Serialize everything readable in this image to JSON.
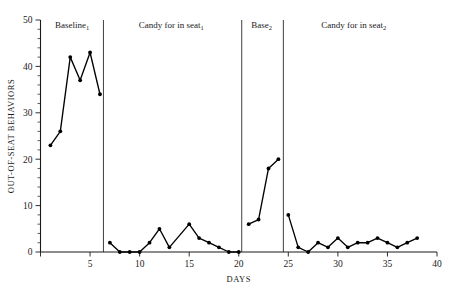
{
  "chart_data": {
    "type": "line",
    "title": "",
    "xlabel": "DAYS",
    "ylabel": "OUT-OF-SEAT BEHAVIORS",
    "xlim": [
      0,
      40
    ],
    "ylim": [
      0,
      50
    ],
    "xticks": [
      0,
      5,
      10,
      15,
      20,
      25,
      30,
      35,
      40
    ],
    "xtick_labels": [
      "",
      "5",
      "10",
      "15",
      "20",
      "25",
      "30",
      "35",
      "40"
    ],
    "yticks": [
      0,
      10,
      20,
      30,
      40,
      50
    ],
    "ytick_labels": [
      "0",
      "10",
      "20",
      "30",
      "40",
      "50"
    ],
    "yminor_step": 2,
    "grid": false,
    "legend": "none",
    "series": [
      {
        "name": "Out-of-seat behaviors",
        "x": [
          1,
          2,
          3,
          4,
          5,
          6,
          7,
          8,
          9,
          10,
          11,
          12,
          13,
          15,
          16,
          17,
          18,
          19,
          20,
          21,
          22,
          23,
          24,
          25,
          26,
          27,
          28,
          29,
          30,
          31,
          32,
          33,
          34,
          35,
          36,
          37,
          38
        ],
        "values": [
          23,
          26,
          42,
          37,
          43,
          34,
          2,
          0,
          0,
          0,
          2,
          5,
          1,
          6,
          3,
          2,
          1,
          0,
          0,
          6,
          7,
          18,
          20,
          8,
          1,
          0,
          2,
          1,
          3,
          1,
          2,
          2,
          3,
          2,
          1,
          2,
          3
        ]
      }
    ],
    "phases": [
      {
        "name": "baseline-1",
        "label": "Baseline",
        "sub": "1",
        "start": 0.0,
        "end": 6.35,
        "label_x": 3.2
      },
      {
        "name": "candy-in-seat-1",
        "label": "Candy for in seat",
        "sub": "1",
        "start": 6.35,
        "end": 20.3,
        "label_x": 13.2
      },
      {
        "name": "base-2",
        "label": "Base",
        "sub": "2",
        "start": 20.3,
        "end": 24.5,
        "label_x": 22.3
      },
      {
        "name": "candy-in-seat-2",
        "label": "Candy for in seat",
        "sub": "2",
        "start": 24.5,
        "end": 40.0,
        "label_x": 31.6
      }
    ],
    "separators": [
      6.35,
      20.3,
      24.5
    ]
  }
}
